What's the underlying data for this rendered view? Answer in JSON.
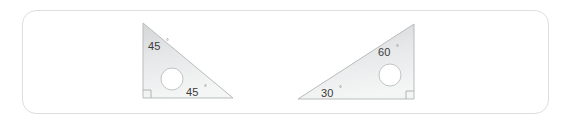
{
  "card": {
    "background_color": "#ffffff",
    "border_color": "#dedede"
  },
  "figures": [
    {
      "name": "set-square-45",
      "type": "right triangle",
      "description": "45-45-90 set square with circular finger hole",
      "fill_top_color": "#d9dadc",
      "fill_bottom_color": "#f2f3f4",
      "edge_color": "#b9bbbd",
      "hole_fill": "#ffffff",
      "angles": [
        {
          "value": "45",
          "degree_symbol": "°",
          "position": "top-left"
        },
        {
          "value": "45",
          "degree_symbol": "°",
          "position": "bottom-right"
        }
      ],
      "right_angle_marker": "bottom-left"
    },
    {
      "name": "set-square-30-60",
      "type": "right triangle",
      "description": "30-60-90 set square with circular finger hole",
      "fill_top_color": "#d9dadc",
      "fill_bottom_color": "#f2f3f4",
      "edge_color": "#b9bbbd",
      "hole_fill": "#ffffff",
      "angles": [
        {
          "value": "60",
          "degree_symbol": "°",
          "position": "top-right"
        },
        {
          "value": "30",
          "degree_symbol": "°",
          "position": "bottom-left"
        }
      ],
      "right_angle_marker": "bottom-right"
    }
  ]
}
